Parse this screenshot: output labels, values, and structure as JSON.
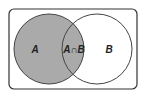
{
  "diagram": {
    "type": "venn",
    "sets": [
      {
        "id": "A",
        "label": "A",
        "shaded": true
      },
      {
        "id": "B",
        "label": "B",
        "shaded": false
      }
    ],
    "intersection": {
      "label": "A∩B",
      "shaded": true
    },
    "colors": {
      "shade": "#aaaaaa",
      "stroke": "#333333",
      "background": "#ffffff"
    }
  }
}
